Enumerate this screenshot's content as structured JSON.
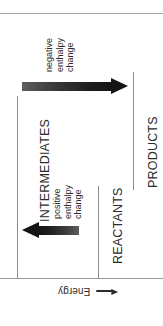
{
  "figure": {
    "orientation": "rotated",
    "background_color": "#ffffff",
    "rule_color": "#a8a8a8",
    "text_color": "#2b2b2b",
    "arrow_color_dark": "#141414",
    "arrow_color_light": "#5e5e5e"
  },
  "axis": {
    "energy_label": "Energy",
    "energy_arrow_icon": "left-arrow-icon"
  },
  "states": {
    "products": "PRODUCTS",
    "reactants": "REACTANTS",
    "intermediates": "INTERMEDIATES"
  },
  "annotations": {
    "negative": {
      "line1": "negative",
      "line2": "enthalpy",
      "line3": "change"
    },
    "positive": {
      "line1": "positive",
      "line2": "enthalpy",
      "line3": "change"
    }
  },
  "chart_data": {
    "type": "line",
    "xlabel": "Reaction coordinate",
    "ylabel": "Energy",
    "grid": false,
    "legend": null,
    "orientation": "rotated-90-ccw",
    "categories": [
      "REACTANTS",
      "INTERMEDIATES",
      "PRODUCTS"
    ],
    "levels": [
      {
        "name": "REACTANTS",
        "order": 1,
        "relative_energy": 1
      },
      {
        "name": "INTERMEDIATES",
        "order": 2,
        "relative_energy": 2
      },
      {
        "name": "PRODUCTS",
        "order": 3,
        "relative_energy": 0
      }
    ],
    "transitions": [
      {
        "from": "REACTANTS",
        "to": "INTERMEDIATES",
        "label": "positive enthalpy change",
        "sign": "positive",
        "direction": "up"
      },
      {
        "from": "INTERMEDIATES",
        "to": "PRODUCTS",
        "label": "negative enthalpy change",
        "sign": "negative",
        "direction": "down"
      }
    ]
  }
}
